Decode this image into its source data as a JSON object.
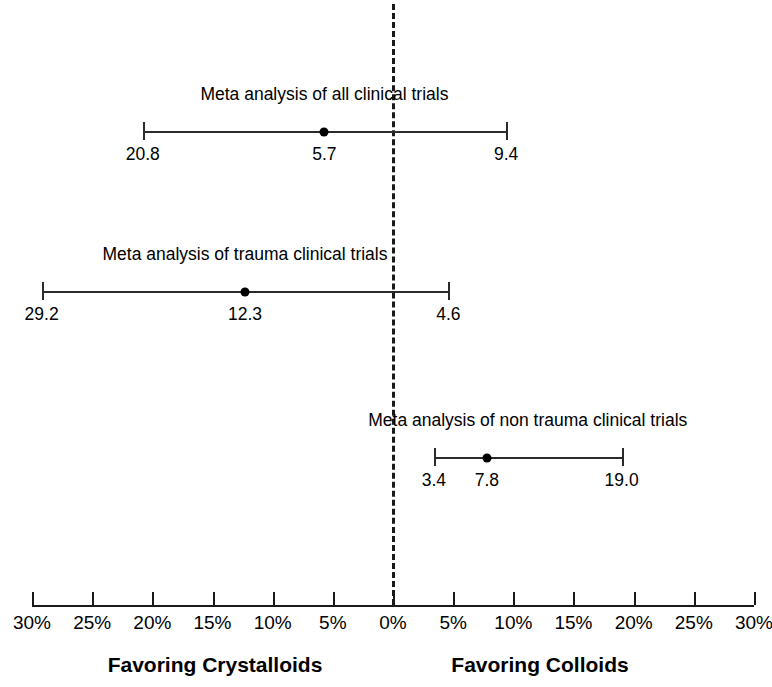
{
  "chart_data": {
    "type": "scatter",
    "title": "",
    "xlabel": "Absolute risk difference in mortality (%)",
    "ylabel": "",
    "xlim": [
      -30,
      30
    ],
    "grid": false,
    "legend": "none",
    "axis": {
      "tick_labels": [
        "30%",
        "25%",
        "20%",
        "15%",
        "10%",
        "5%",
        "0%",
        "5%",
        "10%",
        "15%",
        "20%",
        "25%",
        "30%"
      ],
      "tick_values": [
        -30,
        -25,
        -20,
        -15,
        -10,
        -5,
        0,
        5,
        10,
        15,
        20,
        25,
        30
      ],
      "zero_reference": 0
    },
    "direction_labels": {
      "left": "Favoring Crystalloids",
      "right": "Favoring Colloids"
    },
    "series": [
      {
        "name": "Meta analysis of all clinical trials",
        "estimate": -5.7,
        "estimate_label": "5.7",
        "ci_low": -20.8,
        "ci_low_label": "20.8",
        "ci_high": 9.4,
        "ci_high_label": "9.4"
      },
      {
        "name": "Meta analysis of trauma clinical trials",
        "estimate": -12.3,
        "estimate_label": "12.3",
        "ci_low": -29.2,
        "ci_low_label": "29.2",
        "ci_high": 4.6,
        "ci_high_label": "4.6"
      },
      {
        "name": "Meta analysis of non trauma clinical trials",
        "estimate": 7.8,
        "estimate_label": "7.8",
        "ci_low": 3.4,
        "ci_low_label": "3.4",
        "ci_high": 19.0,
        "ci_high_label": "19.0"
      }
    ]
  },
  "layout": {
    "zero_x_px": 393,
    "px_per_percent": 12.033,
    "axis_y_px": 605,
    "zero_line_top_px": 4,
    "zero_line_bottom_px": 605,
    "row_bar_y_px": [
      131,
      291,
      457
    ],
    "row_label_y_px": [
      86,
      246,
      412
    ],
    "row_value_y_px": [
      146,
      306,
      472
    ],
    "cap_half_height_px": 9,
    "tick_height_px": 13,
    "tick_label_y_px": 613,
    "caption_y_px": 654,
    "caption_left_x_px": 215,
    "caption_right_x_px": 540
  },
  "colors": {
    "ink": "#000000",
    "line": "#2b2b2b",
    "background": "#ffffff"
  }
}
